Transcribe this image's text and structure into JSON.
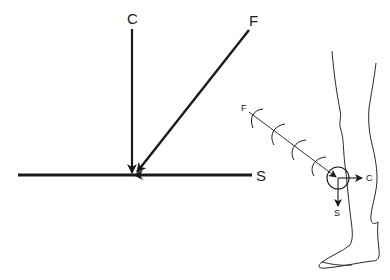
{
  "force_diagram": {
    "labels": {
      "compression": "C",
      "force": "F",
      "shear": "S"
    },
    "vectors": [
      {
        "name": "compression",
        "direction": "downward"
      },
      {
        "name": "force",
        "direction": "diagonal down-left"
      },
      {
        "name": "shear",
        "direction": "leftward"
      }
    ]
  },
  "leg_diagram": {
    "labels": {
      "force": "F",
      "compression": "C",
      "shear": "S"
    },
    "wave_arcs": 4,
    "impact_point": "knee"
  },
  "colors": {
    "line": "#1a1a1a",
    "background": "#ffffff"
  }
}
